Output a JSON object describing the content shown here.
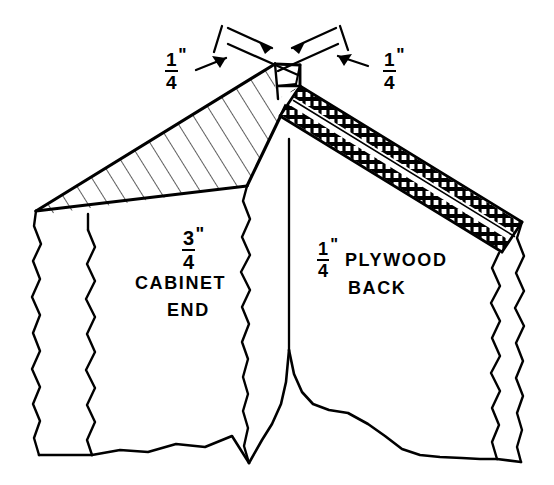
{
  "drawing": {
    "title": "Rabbet joint between cabinet end and plywood back",
    "type": "isometric-detail",
    "line_color": "#000000",
    "background": "#ffffff",
    "hatch_color": "#000000"
  },
  "dimensions": {
    "top_left": {
      "numerator": "1",
      "denominator": "4",
      "unit_mark": "\"",
      "value": "1/4\"",
      "role": "rabbet-depth-left"
    },
    "top_right": {
      "numerator": "1",
      "denominator": "4",
      "unit_mark": "\"",
      "value": "1/4\"",
      "role": "rabbet-width-right"
    },
    "cabinet_end": {
      "numerator": "3",
      "denominator": "4",
      "unit_mark": "\"",
      "value": "3/4\"",
      "role": "cabinet-end-thickness"
    },
    "plywood_back": {
      "numerator": "1",
      "denominator": "4",
      "unit_mark": "\"",
      "value": "1/4\"",
      "role": "plywood-thickness"
    }
  },
  "labels": {
    "cabinet_end_line1": "CABINET",
    "cabinet_end_line2": "END",
    "plywood_line1": "PLYWOOD",
    "plywood_line2": "BACK"
  },
  "parts": [
    {
      "name": "cabinet-end",
      "label": "CABINET END",
      "thickness": "3/4\"",
      "section_fill": "diagonal-hatch",
      "position": "left"
    },
    {
      "name": "plywood-back",
      "label": "PLYWOOD BACK",
      "thickness": "1/4\"",
      "section_fill": "plywood-ply-ladder",
      "position": "right"
    }
  ],
  "annotations": {
    "arrow_count": 4,
    "break_lines": 3,
    "break_line_note": "jagged break lines at left, right and bottom indicate parts continue"
  }
}
